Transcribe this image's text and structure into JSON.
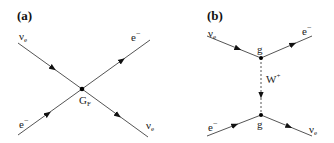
{
  "panels": [
    {
      "id": "a",
      "label": "(a)",
      "labels": {
        "top_left": "ν",
        "top_left_sub": "e",
        "top_right": "e",
        "top_right_sup": "−",
        "bottom_left": "e",
        "bottom_left_sup": "−",
        "bottom_right": "ν",
        "bottom_right_sub": "e",
        "vertex": "G",
        "vertex_sub": "F"
      }
    },
    {
      "id": "b",
      "label": "(b)",
      "labels": {
        "top_left": "ν",
        "top_left_sub": "e",
        "top_right": "e",
        "top_right_sup": "−",
        "top_vertex": "g",
        "propagator": "W",
        "propagator_sup": "+",
        "bottom_vertex": "g",
        "bottom_left": "e",
        "bottom_left_sup": "−",
        "bottom_right": "ν",
        "bottom_right_sub": "e"
      }
    }
  ],
  "colors": {
    "line": "#555555",
    "arrow": "#111111",
    "vertex": "#000000"
  }
}
